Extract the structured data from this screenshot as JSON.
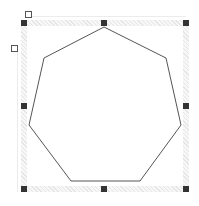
{
  "shape": {
    "type": "heptagon",
    "stroke_color": "#555555",
    "fill_color": "#ffffff",
    "vertices": [
      [
        104,
        27
      ],
      [
        166,
        58
      ],
      [
        181,
        125
      ],
      [
        140,
        181
      ],
      [
        71,
        181
      ],
      [
        29,
        125
      ],
      [
        44,
        58
      ]
    ]
  },
  "selection": {
    "bounds": {
      "left": 24,
      "top": 23,
      "right": 186,
      "bottom": 189
    },
    "band_color": "#e6e6e6",
    "handle_color": "#333333",
    "resize_handles": [
      {
        "name": "top-left",
        "x": 24,
        "y": 23
      },
      {
        "name": "top-middle",
        "x": 104,
        "y": 23
      },
      {
        "name": "top-right",
        "x": 186,
        "y": 23
      },
      {
        "name": "middle-left",
        "x": 24,
        "y": 106
      },
      {
        "name": "middle-right",
        "x": 186,
        "y": 106
      },
      {
        "name": "bottom-left",
        "x": 24,
        "y": 189
      },
      {
        "name": "bottom-middle",
        "x": 104,
        "y": 189
      },
      {
        "name": "bottom-right",
        "x": 186,
        "y": 189
      }
    ],
    "control_handles": [
      {
        "name": "rotate",
        "x": 28,
        "y": 14
      },
      {
        "name": "adjust",
        "x": 14,
        "y": 49
      }
    ]
  }
}
